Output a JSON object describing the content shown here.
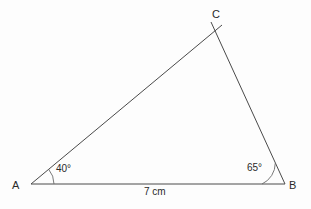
{
  "figure": {
    "type": "geometry-diagram",
    "shape": "triangle",
    "background_color": "#fdfdfd",
    "stroke_color": "#3a3a3a",
    "text_color": "#2a2a2a",
    "vertices": {
      "a": {
        "label": "A",
        "x": 31,
        "y": 184
      },
      "b": {
        "label": "B",
        "x": 285,
        "y": 184
      },
      "c": {
        "label": "C",
        "x": 216,
        "y": 30
      }
    },
    "angles": {
      "a": {
        "label": "40°",
        "value": 40,
        "arc_radius": 23
      },
      "b": {
        "label": "65°",
        "value": 65,
        "arc_radius": 23
      }
    },
    "sides": {
      "ab": {
        "label": "7 cm",
        "length": 7,
        "unit": "cm"
      }
    }
  }
}
